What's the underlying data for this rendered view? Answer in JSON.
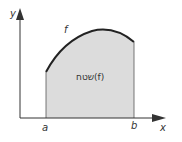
{
  "diagram": {
    "axis_x_label": "x",
    "axis_y_label": "y",
    "function_label": "f",
    "area_label": "שטח(f)",
    "tick_a": "a",
    "tick_b": "b",
    "colors": {
      "fill": "#dcdcdc",
      "stroke": "#222222",
      "axis": "#333333"
    }
  }
}
